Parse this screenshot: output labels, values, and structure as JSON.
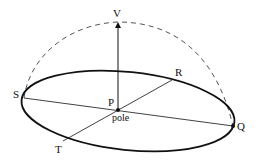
{
  "diagram": {
    "colors": {
      "stroke": "#111111",
      "dashed": "#555555",
      "background": "#ffffff"
    },
    "labels": {
      "V": "V",
      "R": "R",
      "S": "S",
      "P": "P",
      "pole": "pole",
      "Q": "Q",
      "T": "T"
    },
    "points": {
      "V": [
        118,
        22
      ],
      "P": [
        118,
        110
      ],
      "S": [
        24,
        98
      ],
      "Q": [
        233,
        126
      ],
      "R": [
        172,
        80
      ],
      "T": [
        63,
        141
      ]
    }
  }
}
